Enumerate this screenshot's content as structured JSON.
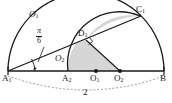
{
  "figure": {
    "background_color": "#ffffff",
    "stroke_color": "#1a1a1a",
    "shade_color": "#d6d6d6",
    "baseline_length_label": "2",
    "angle_label": {
      "numerator": "π",
      "denominator": "6"
    },
    "points": [
      {
        "id": "A1",
        "letter": "A",
        "subscript": "1",
        "x": 8,
        "y": 71
      },
      {
        "id": "A2",
        "letter": "A",
        "subscript": "2",
        "x": 68,
        "y": 71
      },
      {
        "id": "O1",
        "letter": "O",
        "subscript": "1",
        "x": 96,
        "y": 71
      },
      {
        "id": "O2",
        "letter": "O",
        "subscript": "2",
        "x": 120,
        "y": 71
      },
      {
        "id": "B",
        "letter": "B",
        "subscript": "",
        "x": 164,
        "y": 71
      },
      {
        "id": "D1",
        "letter": "D",
        "subscript": "1",
        "x": 86,
        "y": 40
      },
      {
        "id": "C1",
        "letter": "C",
        "subscript": "1",
        "x": 140,
        "y": 16
      }
    ],
    "curve_labels": [
      {
        "id": "O1-arc",
        "letter": "O",
        "subscript": "1",
        "x": 33,
        "y": 14
      },
      {
        "id": "O2-arc",
        "letter": "O",
        "subscript": "2",
        "x": 58,
        "y": 58
      }
    ],
    "markers": {
      "center_dot_O1": true,
      "center_dot_O2": true,
      "right_angle_at_D1": true,
      "angle_arc_at_A1": true
    },
    "annotations": {
      "length_label": "2",
      "length_label_x": 86,
      "length_label_y": 93
    }
  }
}
